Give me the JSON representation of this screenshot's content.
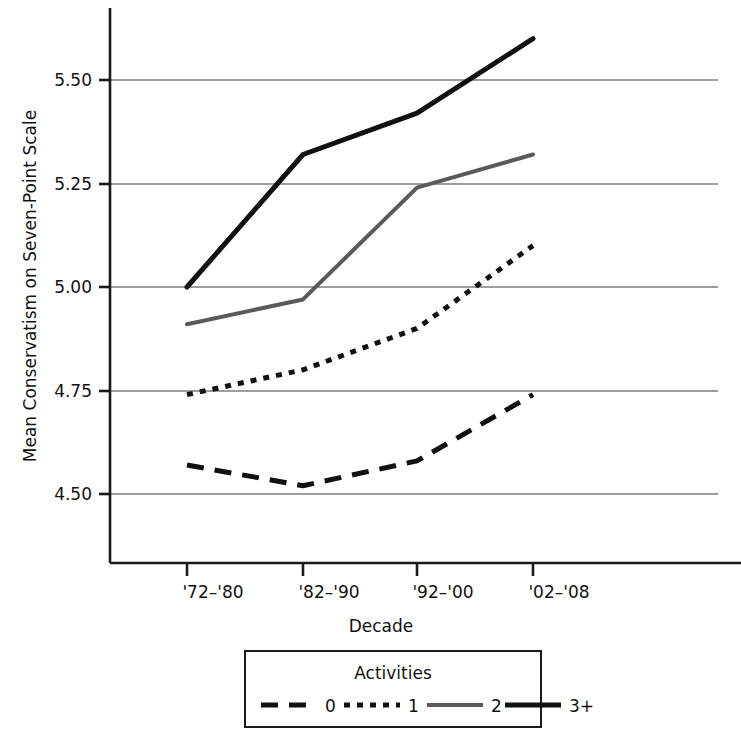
{
  "chart_data": {
    "type": "line",
    "title": "",
    "xlabel": "Decade",
    "ylabel": "Mean Conservatism on Seven-Point Scale",
    "categories": [
      "'72–'80",
      "'82–'90",
      "'92–'00",
      "'02–'08"
    ],
    "yticks": [
      "4.50",
      "4.75",
      "5.00",
      "5.25",
      "5.50"
    ],
    "ytick_values": [
      4.5,
      4.75,
      5.0,
      5.25,
      5.5
    ],
    "ylim": [
      4.38,
      5.66
    ],
    "grid": "horizontal",
    "legend_position": "bottom",
    "legend_title": "Activities",
    "series": [
      {
        "name": "0",
        "style": "dashed",
        "color": "#111111",
        "width": 5,
        "dash": "17,11",
        "values": [
          4.57,
          4.52,
          4.58,
          4.74
        ]
      },
      {
        "name": "1",
        "style": "dotted",
        "color": "#111111",
        "width": 5,
        "dash": "6,7",
        "values": [
          4.74,
          4.8,
          4.9,
          5.1
        ]
      },
      {
        "name": "2",
        "style": "solid",
        "color": "#5a5a5a",
        "width": 4,
        "dash": "none",
        "values": [
          4.91,
          4.97,
          5.24,
          5.32
        ]
      },
      {
        "name": "3+",
        "style": "solid",
        "color": "#111111",
        "width": 5,
        "dash": "none",
        "values": [
          5.0,
          5.32,
          5.42,
          5.6
        ]
      }
    ]
  },
  "axis": {
    "ylabel": "Mean Conservatism on Seven-Point Scale",
    "xlabel": "Decade",
    "ytick_0": "4.50",
    "ytick_1": "4.75",
    "ytick_2": "5.00",
    "ytick_3": "5.25",
    "ytick_4": "5.50",
    "xtick_0": "'72–'80",
    "xtick_1": "'82–'90",
    "xtick_2": "'92–'00",
    "xtick_3": "'02–'08"
  },
  "legend": {
    "title": "Activities",
    "item_0": "0",
    "item_1": "1",
    "item_2": "2",
    "item_3": "3+"
  },
  "colors": {
    "line_dark": "#111111",
    "line_gray": "#5a5a5a",
    "grid": "#808080",
    "axis": "#1a1a1a",
    "background": "#ffffff"
  }
}
